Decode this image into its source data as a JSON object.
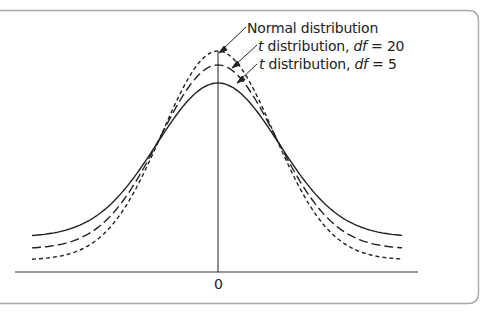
{
  "chart_data": {
    "type": "line",
    "title": "",
    "xlabel": "",
    "ylabel": "",
    "x_ticks": [
      "0"
    ],
    "grid": false,
    "legend_position": "annotations near peaks, upper center-right",
    "series": [
      {
        "name": "Normal distribution",
        "style": "dotted",
        "peak_density": 0.399
      },
      {
        "name": "t distribution, df = 20",
        "style": "dashed",
        "peak_density": 0.394
      },
      {
        "name": "t distribution, df = 5",
        "style": "solid",
        "peak_density": 0.38
      }
    ]
  },
  "labels": {
    "normal": "Normal distribution",
    "t20_prefix": "t",
    "t20_mid": " distribution, ",
    "t20_df": "df",
    "t20_suffix": " = 20",
    "t5_prefix": "t",
    "t5_mid": " distribution, ",
    "t5_df": "df",
    "t5_suffix": " = 5"
  },
  "axis": {
    "zero_label": "0"
  },
  "colors": {
    "line": "#2a2a2a",
    "frame": "#9a9a9a"
  }
}
